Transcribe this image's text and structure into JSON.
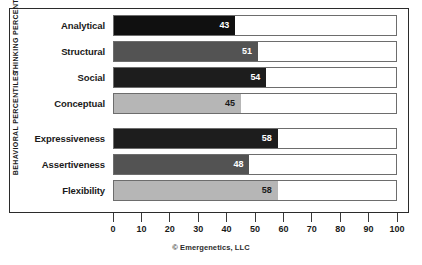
{
  "credit": "© Emergenetics, LLC",
  "groups": [
    {
      "id": "thinking",
      "label": "THINKING PERCENTILES"
    },
    {
      "id": "behavioral",
      "label": "BEHAVIORAL PERCENTILES"
    }
  ],
  "axis": {
    "ticks": [
      "0",
      "10",
      "20",
      "30",
      "40",
      "50",
      "60",
      "70",
      "80",
      "90",
      "100"
    ]
  },
  "chart_data": {
    "type": "bar",
    "orientation": "horizontal",
    "title": "",
    "xlabel": "",
    "ylabel": "",
    "xlim": [
      0,
      100
    ],
    "grid": false,
    "legend": "none",
    "categories": [
      "Analytical",
      "Structural",
      "Social",
      "Conceptual",
      "Expressiveness",
      "Assertiveness",
      "Flexibility"
    ],
    "values": [
      43,
      51,
      54,
      45,
      58,
      48,
      58
    ],
    "groups": [
      "thinking",
      "thinking",
      "thinking",
      "thinking",
      "behavioral",
      "behavioral",
      "behavioral"
    ],
    "bars": [
      {
        "label": "Analytical",
        "value": 43,
        "color": "#101010",
        "value_color": "#ffffff",
        "group": "thinking"
      },
      {
        "label": "Structural",
        "value": 51,
        "color": "#535353",
        "value_color": "#ffffff",
        "group": "thinking"
      },
      {
        "label": "Social",
        "value": 54,
        "color": "#1d1d1d",
        "value_color": "#ffffff",
        "group": "thinking"
      },
      {
        "label": "Conceptual",
        "value": 45,
        "color": "#b6b6b6",
        "value_color": "#1a1a1a",
        "group": "thinking"
      },
      {
        "label": "Expressiveness",
        "value": 58,
        "color": "#1d1d1d",
        "value_color": "#ffffff",
        "group": "behavioral"
      },
      {
        "label": "Assertiveness",
        "value": 48,
        "color": "#535353",
        "value_color": "#ffffff",
        "group": "behavioral"
      },
      {
        "label": "Flexibility",
        "value": 58,
        "color": "#b6b6b6",
        "value_color": "#1a1a1a",
        "group": "behavioral"
      }
    ]
  }
}
